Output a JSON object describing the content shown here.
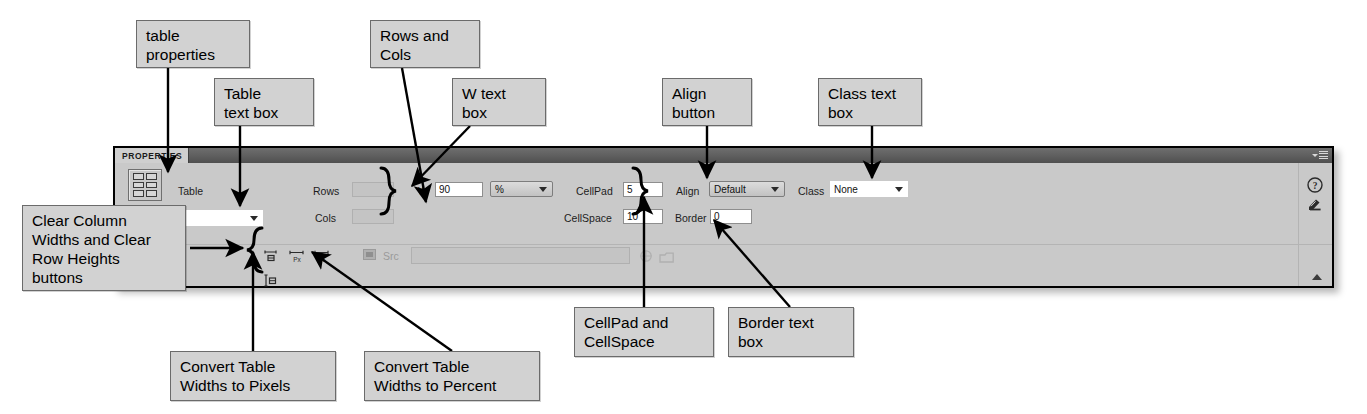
{
  "panel": {
    "tab_label": "PROPERTIES",
    "menu_icon": "panel-menu-icon",
    "table_icon": "table-grid-icon",
    "fields": {
      "table_label": "Table",
      "table_value": "",
      "rows_label": "Rows",
      "rows_value": "",
      "cols_label": "Cols",
      "cols_value": "",
      "w_label": "W",
      "w_value": "90",
      "w_unit_value": "%",
      "cellpad_label": "CellPad",
      "cellpad_value": "5",
      "cellspace_label": "CellSpace",
      "cellspace_value": "10",
      "align_label": "Align",
      "align_value": "Default",
      "border_label": "Border",
      "border_value": "0",
      "class_label": "Class",
      "class_value": "None",
      "src_label": "Src",
      "src_value": ""
    },
    "width_buttons": [
      "clear-column-widths-button",
      "convert-table-widths-to-pixels-button",
      "convert-table-widths-to-percent-button",
      "clear-row-heights-button"
    ],
    "gutter_icons": [
      "help-icon",
      "edit-properties-icon"
    ],
    "collapse_icon": "collapse-triangle-icon"
  },
  "callouts": [
    {
      "id": "table-properties",
      "text": "table\nproperties"
    },
    {
      "id": "table-text-box",
      "text": "Table\ntext box"
    },
    {
      "id": "rows-and-cols",
      "text": "Rows and\nCols"
    },
    {
      "id": "w-text-box",
      "text": "W text\nbox"
    },
    {
      "id": "align-button",
      "text": "Align\nbutton"
    },
    {
      "id": "class-text-box",
      "text": "Class text\nbox"
    },
    {
      "id": "clear-widths-heights",
      "text": "Clear Column\nWidths and Clear\nRow Heights\nbuttons"
    },
    {
      "id": "convert-pixels",
      "text": "Convert Table\nWidths to Pixels"
    },
    {
      "id": "convert-percent",
      "text": "Convert Table\nWidths to Percent"
    },
    {
      "id": "cellpad-cellspace",
      "text": "CellPad and\nCellSpace"
    },
    {
      "id": "border-text-box",
      "text": "Border text\nbox"
    }
  ],
  "colors": {
    "panel_bg": "#c9c9c9",
    "titlebar": "#5e5e5e",
    "callout_bg": "#d2d2d2",
    "field_bg": "#ffffff",
    "disabled_field": "#c4c4c4",
    "line": "#000000"
  }
}
